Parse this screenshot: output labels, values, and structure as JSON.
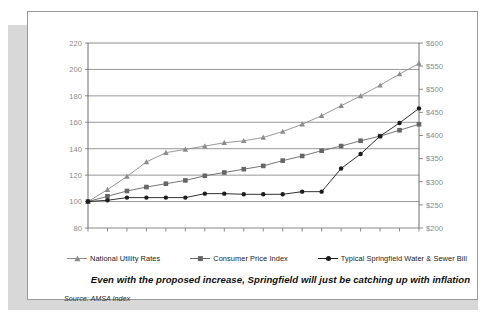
{
  "card": {
    "source_prefix": "Source:",
    "source_value": " AMSA Index",
    "caption": "Even with the proposed increase, Springfield will just be catching up with inflation"
  },
  "colors": {
    "series_national_utility": "#8d8d8d",
    "series_cpi": "#666666",
    "series_springfield": "#1c1c1c",
    "gridline": "#7d7d7d",
    "axis": "#6f6f6f",
    "left_axis_label": "#8a8a8a",
    "right_axis_label": "#8a8a8a",
    "card_border": "#9a9a9a",
    "shadow": "#d8d8d8",
    "background": "#ffffff"
  },
  "chart_data": {
    "type": "line",
    "title": "",
    "xlabel": "",
    "ylabel": "",
    "grid": true,
    "legend_position": "bottom",
    "x": [
      "90",
      "91",
      "92",
      "93",
      "94",
      "95",
      "96",
      "97",
      "98",
      "99",
      "00",
      "01",
      "02",
      "03",
      "04",
      "05",
      "06",
      "07"
    ],
    "left_axis": {
      "ylim": [
        80,
        220
      ],
      "ticks": [
        220,
        200,
        180,
        160,
        140,
        120,
        100,
        80
      ],
      "tick_labels": [
        "220",
        "200",
        "180",
        "160",
        "140",
        "120",
        "100",
        "80"
      ]
    },
    "right_axis": {
      "ylim": [
        200,
        600
      ],
      "ticks": [
        600,
        550,
        500,
        450,
        400,
        350,
        300,
        250,
        200
      ],
      "tick_labels": [
        "$600",
        "$550",
        "$500",
        "$450",
        "$400",
        "$350",
        "$300",
        "$250",
        "$200"
      ]
    },
    "series": [
      {
        "name": "National Utility Rates",
        "marker": "triangle",
        "axis": "left",
        "values": [
          100,
          109,
          119,
          130,
          137,
          139.5,
          142,
          144.5,
          146,
          148.5,
          153,
          158.5,
          165,
          172.5,
          180,
          188,
          196.5,
          204.5
        ]
      },
      {
        "name": "Consumer Price Index",
        "marker": "square",
        "axis": "left",
        "values": [
          100,
          104,
          108,
          111,
          113.5,
          116,
          119.5,
          122,
          124.5,
          127,
          131,
          134.5,
          138.5,
          142,
          146,
          149.5,
          154,
          158.5
        ]
      },
      {
        "name": "Typical Springfield Water & Sewer Bill",
        "marker": "circle",
        "axis": "left",
        "values": [
          100,
          101,
          103,
          103,
          103,
          103,
          106,
          106,
          105.5,
          105.5,
          105.5,
          107.5,
          107.5,
          125,
          136,
          149.5,
          159.5,
          170.5
        ]
      }
    ]
  }
}
